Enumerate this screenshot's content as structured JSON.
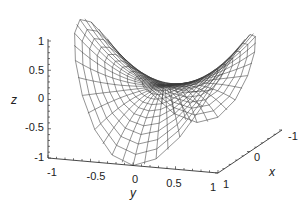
{
  "chart_data": {
    "type": "surface3d-wireframe",
    "title": "",
    "surface": {
      "description": "Saddle surface z = y^2 - x^2 (r^2 cos 2θ) on unit disk, polar wireframe mesh",
      "domain": "unit disk",
      "radial_rings": 12,
      "angular_spokes": 24
    },
    "axes": {
      "x": {
        "label": "x",
        "range": [
          -1,
          1
        ],
        "ticks": [
          "-1",
          "0",
          "1"
        ]
      },
      "y": {
        "label": "y",
        "range": [
          -1,
          1
        ],
        "ticks": [
          "-1",
          "-0.5",
          "0",
          "0.5",
          "1"
        ]
      },
      "z": {
        "label": "z",
        "range": [
          -1,
          1
        ],
        "ticks": [
          "-1",
          "-0.5",
          "0",
          "0.5",
          "1"
        ]
      }
    },
    "colors": {
      "mesh": "#3a3a3a",
      "axis": "#333333",
      "background": "#ffffff"
    },
    "grid": false,
    "legend": null
  },
  "labels": {
    "x_axis": "x",
    "y_axis": "y",
    "z_axis": "z",
    "z_ticks": [
      "1",
      "0.5",
      "0",
      "-0.5",
      "-1"
    ],
    "y_ticks": [
      "-1",
      "-0.5",
      "0",
      "0.5",
      "1"
    ],
    "x_ticks": [
      "1",
      "0",
      "-1"
    ]
  }
}
